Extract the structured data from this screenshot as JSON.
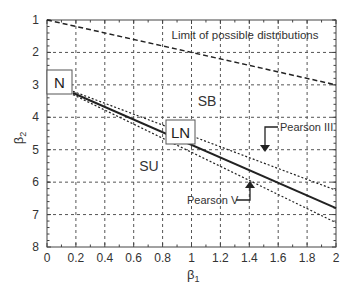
{
  "chart_data": {
    "type": "line",
    "title": "",
    "xlabel": "β1",
    "ylabel": "β2",
    "xlim": [
      0,
      2
    ],
    "ylim": [
      8,
      1
    ],
    "y_inverted": true,
    "grid": true,
    "x_ticks": [
      "0",
      "0.2",
      "0.4",
      "0.6",
      "0.8",
      "1",
      "1.2",
      "1.4",
      "1.6",
      "1.8",
      "2"
    ],
    "y_ticks": [
      "1",
      "2",
      "3",
      "4",
      "5",
      "6",
      "7",
      "8"
    ],
    "series": [
      {
        "name": "Limit of possible distributions",
        "style": "dashed",
        "x": [
          0,
          2
        ],
        "y": [
          1,
          3
        ]
      },
      {
        "name": "Pearson III",
        "style": "dotted",
        "x": [
          0.18,
          2
        ],
        "y": [
          3.2,
          6.25
        ]
      },
      {
        "name": "LN",
        "style": "solid",
        "x": [
          0.18,
          2
        ],
        "y": [
          3.25,
          6.8
        ]
      },
      {
        "name": "Pearson V",
        "style": "dotted",
        "x": [
          0.18,
          2
        ],
        "y": [
          3.3,
          7.25
        ]
      }
    ],
    "annotations": [
      {
        "text": "Limit of possible distributions",
        "x": 1.35,
        "y": 1.4
      },
      {
        "text": "SB",
        "x": 0.9,
        "y": 3.5
      },
      {
        "text": "SU",
        "x": 0.72,
        "y": 5.5
      },
      {
        "text": "N",
        "x": 0.0,
        "y": 3.0,
        "boxed": true
      },
      {
        "text": "LN",
        "x": 0.82,
        "y": 4.6,
        "boxed": true
      },
      {
        "text": "Pearson III",
        "x": 1.55,
        "y": 4.4,
        "arrow_to": [
          1.5,
          5.1
        ]
      },
      {
        "text": "Pearson V",
        "x": 1.1,
        "y": 6.3,
        "arrow_to": [
          1.4,
          5.8
        ]
      }
    ]
  },
  "labels": {
    "xlabel": "β",
    "xlabel_sub": "1",
    "ylabel": "β",
    "ylabel_sub": "2",
    "limit": "Limit of possible distributions",
    "sb": "SB",
    "su": "SU",
    "n": "N",
    "ln": "LN",
    "pearson3": "Pearson III",
    "pearson5": "Pearson V"
  }
}
